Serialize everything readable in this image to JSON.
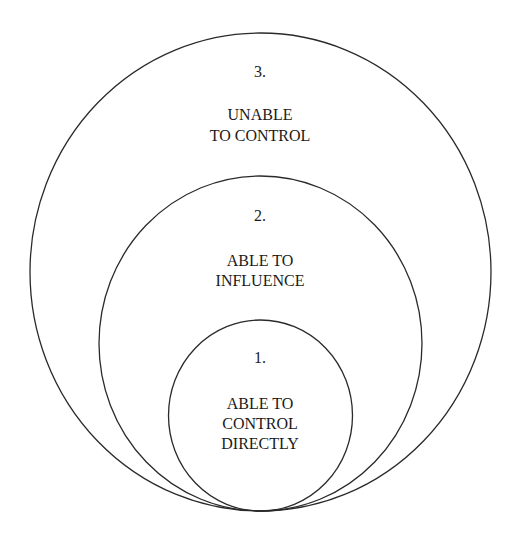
{
  "diagram": {
    "line_color": "#2a2a2a",
    "text_color": "#1a1a1a",
    "background": "#ffffff",
    "circles": [
      {
        "id": "outer",
        "number": "3.",
        "label_lines": [
          "UNABLE",
          "TO CONTROL"
        ]
      },
      {
        "id": "middle",
        "number": "2.",
        "label_lines": [
          "ABLE TO",
          "INFLUENCE"
        ]
      },
      {
        "id": "inner",
        "number": "1.",
        "label_lines": [
          "ABLE TO",
          "CONTROL",
          "DIRECTLY"
        ]
      }
    ]
  }
}
